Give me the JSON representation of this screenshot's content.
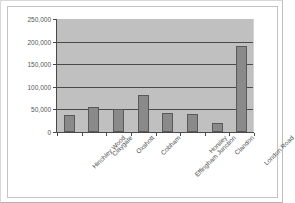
{
  "chart_data": {
    "type": "bar",
    "title": "",
    "xlabel": "",
    "ylabel": "",
    "ylim": [
      0,
      250000
    ],
    "grid": true,
    "legend": false,
    "categories": [
      "Hinchley Wood",
      "Claygate",
      "Oxshott",
      "Cobham",
      "Effingham Junction",
      "Horsley",
      "Clandon",
      "London Road"
    ],
    "values": [
      37000,
      55000,
      51000,
      81000,
      42000,
      39000,
      21000,
      191000
    ],
    "ytick_labels": [
      "0",
      "50,000",
      "100,000",
      "150,000",
      "200,000",
      "250,000"
    ],
    "ytick_values": [
      0,
      50000,
      100000,
      150000,
      200000,
      250000
    ],
    "colors": {
      "bar_fill": "#8a8a8a",
      "bar_edge": "#595959",
      "plot_background": "#c0c0c0",
      "axis": "#4a4a4a",
      "gridline": "#4a4a4a",
      "page_background": "#ffffff",
      "frame_border": "#c4c4c4",
      "tick_text": "#555555"
    }
  }
}
